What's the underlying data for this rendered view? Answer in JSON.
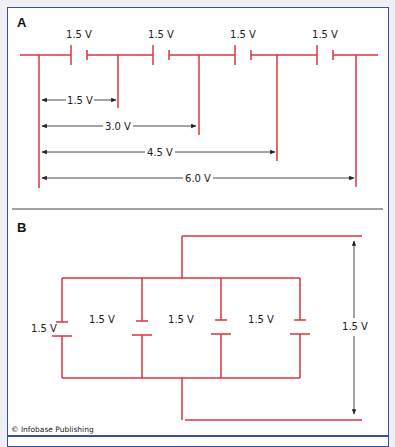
{
  "colors": {
    "wire": "#d9363e",
    "frame": "#3a4fa0",
    "dimension": "#333333",
    "background": "#ffffff"
  },
  "panel_a": {
    "letter": "A",
    "description": "Four cells connected in series",
    "cell_labels": [
      "1.5 V",
      "1.5 V",
      "1.5 V",
      "1.5 V"
    ],
    "measurements": [
      "1.5 V",
      "3.0 V",
      "4.5 V",
      "6.0 V"
    ]
  },
  "panel_b": {
    "letter": "B",
    "description": "Four cells connected in parallel",
    "cell_labels": [
      "1.5 V",
      "1.5 V",
      "1.5 V",
      "1.5 V"
    ],
    "measurement": "1.5 V"
  },
  "credit": "© Infobase Publishing"
}
